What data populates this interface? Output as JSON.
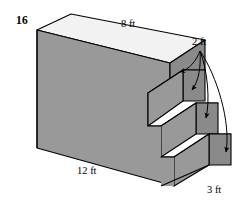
{
  "figure": {
    "kind": "isometric-stepped-solid",
    "problem_number": "16",
    "labels": {
      "top_depth": "8 ft",
      "riser": "2 ft",
      "length": "12 ft",
      "tread": "3 ft"
    },
    "colors": {
      "front_face": "#999999",
      "top_face": "#f2f2f2",
      "step_top_face": "#d9d9d9",
      "side_face": "#8a8a8a",
      "outline": "#000000",
      "background": "#ffffff",
      "text": "#000000"
    },
    "annotations": {
      "leader_origin_x": 200,
      "leader_origin_y": 50,
      "arrow_count": 4,
      "arrow_targets": [
        "top-step-riser",
        "middle-step-riser",
        "lower-step-riser",
        "bottom-step-riser"
      ]
    },
    "geometry": {
      "top_face": "71,14 205,40 170,63 37,30",
      "front_face": "37,30 170,63 170,93 148,93 148,125 161,125 161,156 174,156 174,185 37,148",
      "note": "stepped rectangular prism drawn in oblique projection, three descending steps on right end"
    }
  }
}
